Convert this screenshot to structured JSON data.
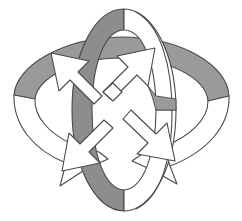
{
  "figure": {
    "title": "Two interlocking rings with four outward arrows",
    "background_color": "#ffffff",
    "outline_color": "#4a4a4a",
    "shade_color": "#9a9a9a",
    "shade_color_dark": "#8d8d8d",
    "fill_color": "#ffffff",
    "canvas": {
      "width": 242,
      "height": 221
    }
  },
  "elements": {
    "horizontal_ring": {
      "name": "horizontal-ring",
      "description": "Wide flattened ellipse band crossing left to right with an arrowhead at each end",
      "shaded_half": "upper-back",
      "center": {
        "x": 121,
        "y": 113
      },
      "radius_x": 116,
      "radius_y": 52,
      "band_thickness": 21
    },
    "vertical_ring": {
      "name": "vertical-ring",
      "description": "Tall narrow ellipse band crossing top to bottom, shaded on the left rear side",
      "shaded_half": "left-back",
      "center": {
        "x": 124,
        "y": 110
      },
      "radius_x": 53,
      "radius_y": 102,
      "band_thickness": 22
    },
    "arrow_cluster": {
      "name": "arrow-pinwheel",
      "description": "Four white block arrows radiating from the centre toward the four diagonal corners",
      "count": 4,
      "fill": "#ffffff",
      "directions": [
        "up-right",
        "down-right",
        "down-left",
        "up-left"
      ]
    },
    "ring_arrowheads": {
      "name": "ring-arrowheads",
      "count": 2,
      "positions": [
        "lower-left",
        "lower-right"
      ]
    }
  }
}
